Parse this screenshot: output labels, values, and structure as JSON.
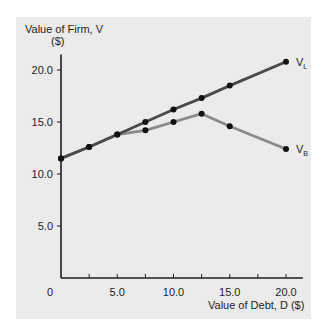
{
  "chart_data": {
    "type": "line",
    "title": "",
    "ylabel": "Value of Firm, V",
    "ylabel_unit": "($)",
    "xlabel": "Value of Debt, D ($)",
    "xlim": [
      0,
      21.5
    ],
    "ylim": [
      0,
      21.5
    ],
    "x_ticks": [
      0,
      2.5,
      5.0,
      7.5,
      10.0,
      12.5,
      15.0,
      17.5,
      20.0
    ],
    "x_tick_labels": [
      {
        "value": 5.0,
        "label": "5.0"
      },
      {
        "value": 10.0,
        "label": "10.0"
      },
      {
        "value": 15.0,
        "label": "15.0"
      },
      {
        "value": 20.0,
        "label": "20.0"
      }
    ],
    "y_ticks": [
      5.0,
      10.0,
      15.0,
      20.0
    ],
    "y_tick_labels": [
      {
        "value": 5.0,
        "label": "5.0"
      },
      {
        "value": 10.0,
        "label": "10.0"
      },
      {
        "value": 15.0,
        "label": "15.0"
      },
      {
        "value": 20.0,
        "label": "20.0"
      }
    ],
    "origin_label": "0",
    "grid": false,
    "legend": "inline labels at line ends",
    "series": [
      {
        "name": "V_L",
        "label_main": "V",
        "label_sub": "L",
        "color": "#4a4a4a",
        "x": [
          0,
          2.5,
          5.0,
          7.5,
          10.0,
          12.5,
          15.0,
          20.0
        ],
        "values": [
          11.5,
          12.6,
          13.8,
          15.0,
          16.2,
          17.3,
          18.5,
          20.8
        ]
      },
      {
        "name": "V_B",
        "label_main": "V",
        "label_sub": "B",
        "color": "#8a8a8a",
        "x": [
          0,
          2.5,
          5.0,
          7.5,
          10.0,
          12.5,
          15.0,
          20.0
        ],
        "values": [
          11.5,
          12.6,
          13.8,
          14.2,
          15.0,
          15.8,
          14.6,
          12.4
        ]
      }
    ]
  },
  "colors": {
    "panel_background": "#ebebeb",
    "axis": "#1e1e1e",
    "marker": "#111111"
  }
}
